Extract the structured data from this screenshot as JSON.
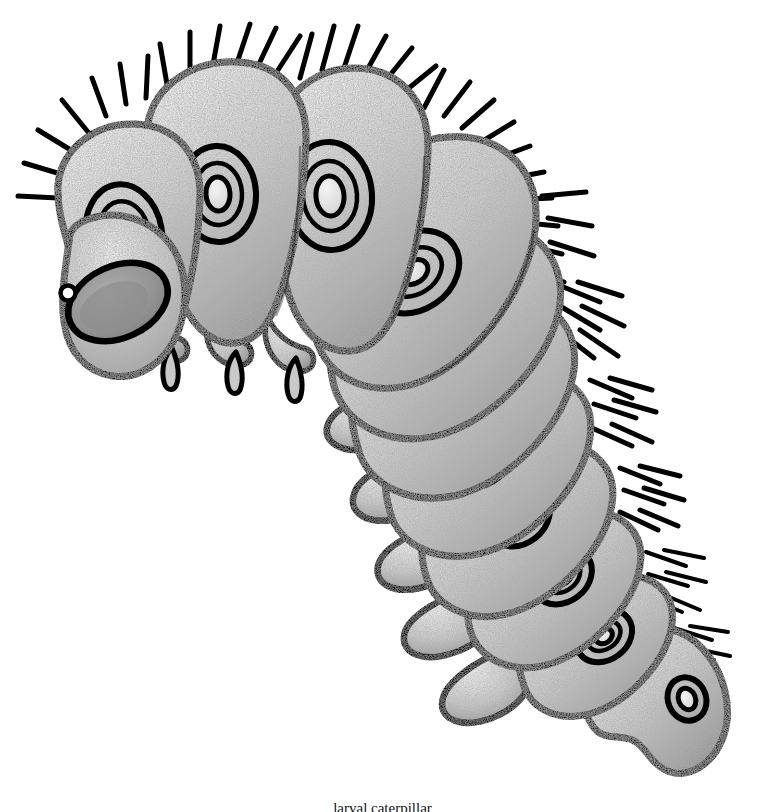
{
  "image": {
    "title": "Caterpillar (lepidopteran larva) line drawing",
    "subject": "caterpillar",
    "style": "black ink outline with graphite stipple shading",
    "background_color": "#ffffff",
    "outline_color": "#000000",
    "body_fill_light": "#e4e4e4",
    "body_fill_mid": "#c2c2c2",
    "body_fill_dark": "#8a8a8a",
    "eye_fill": "#9a9a9a",
    "pupil_color": "#ffffff",
    "width": 765,
    "height": 812,
    "orientation": "head at upper-left, body curving down to tail at lower-right"
  },
  "caption": {
    "text": "larval caterpillar",
    "note": "clipped at bottom edge; only ascender tops visible"
  },
  "anatomy": {
    "head": {
      "label": "head capsule",
      "eye_label": "stemmata / eye spot",
      "pupil_label": "pupil highlight"
    },
    "segments_label": "body segment",
    "spiracle_label": "spiracle",
    "bristle_label": "seta (bristle)",
    "true_leg_label": "thoracic true leg",
    "proleg_label": "abdominal proleg",
    "tail_label": "anal segment / tail"
  },
  "counts": {
    "body_segments": 12,
    "spiracles": 11,
    "true_leg_pairs": 3,
    "prolegs": 5,
    "bristle_clusters": 9
  }
}
